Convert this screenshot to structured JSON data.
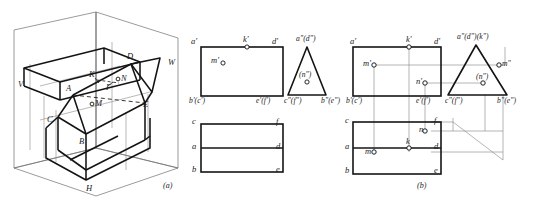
{
  "figure": {
    "captions": [
      {
        "id": "caption-a",
        "text": "(a)",
        "x": 163,
        "y": 186
      },
      {
        "id": "caption-b",
        "text": "(b)",
        "x": 417,
        "y": 186
      }
    ]
  },
  "pictorial": {
    "name": "isometric-projection-box",
    "plane_labels": [
      {
        "id": "plane-v",
        "text": "V",
        "x": 18,
        "y": 84
      },
      {
        "id": "plane-w",
        "text": "W",
        "x": 168,
        "y": 62
      },
      {
        "id": "plane-h",
        "text": "H",
        "x": 86,
        "y": 188
      }
    ],
    "vertex_labels": [
      {
        "id": "vertex-a",
        "text": "A",
        "x": 68,
        "y": 86
      },
      {
        "id": "vertex-b",
        "text": "B",
        "x": 79,
        "y": 141
      },
      {
        "id": "vertex-c",
        "text": "C",
        "x": 48,
        "y": 119
      },
      {
        "id": "vertex-d",
        "text": "D",
        "x": 127,
        "y": 56
      },
      {
        "id": "vertex-e",
        "text": "E",
        "x": 142,
        "y": 104
      },
      {
        "id": "vertex-f",
        "text": "F",
        "x": 109,
        "y": 88
      },
      {
        "id": "vertex-k",
        "text": "K",
        "x": 91,
        "y": 75
      },
      {
        "id": "point-m",
        "text": "M",
        "x": 96,
        "y": 104
      },
      {
        "id": "point-n",
        "text": "N",
        "x": 122,
        "y": 80
      }
    ]
  },
  "views_a": {
    "name": "three-view-set-unsolved",
    "front_view": {
      "name": "front-view-rectangle",
      "labels": [
        {
          "id": "fv-a-prime",
          "text": "a'",
          "x": 192,
          "y": 40
        },
        {
          "id": "fv-k-prime",
          "text": "k'",
          "x": 244,
          "y": 38
        },
        {
          "id": "fv-d-prime",
          "text": "d'",
          "x": 271,
          "y": 40
        },
        {
          "id": "fv-m-prime",
          "text": "m'",
          "x": 210,
          "y": 58
        },
        {
          "id": "fv-bc-prime",
          "text": "b'(c')",
          "x": 190,
          "y": 98
        },
        {
          "id": "fv-ef-prime",
          "text": "e'(f')",
          "x": 253,
          "y": 98
        }
      ]
    },
    "side_view": {
      "name": "side-view-triangle",
      "labels": [
        {
          "id": "sv-ad-dprime",
          "text": "a\"(d\")",
          "x": 304,
          "y": 38
        },
        {
          "id": "sv-n-dprime",
          "text": "(n\")",
          "x": 309,
          "y": 74
        },
        {
          "id": "sv-cf-dprime",
          "text": "c\"(f\")",
          "x": 287,
          "y": 98
        },
        {
          "id": "sv-be-dprime",
          "text": "b\"(e\")",
          "x": 324,
          "y": 98
        }
      ]
    },
    "top_view": {
      "name": "top-view-rectangle",
      "labels": [
        {
          "id": "tv-c",
          "text": "c",
          "x": 192,
          "y": 118
        },
        {
          "id": "tv-f",
          "text": "f",
          "x": 274,
          "y": 118
        },
        {
          "id": "tv-a",
          "text": "a",
          "x": 192,
          "y": 142
        },
        {
          "id": "tv-d",
          "text": "d",
          "x": 274,
          "y": 142
        },
        {
          "id": "tv-b",
          "text": "b",
          "x": 192,
          "y": 165
        },
        {
          "id": "tv-e",
          "text": "e",
          "x": 274,
          "y": 165
        }
      ]
    }
  },
  "views_b": {
    "name": "three-view-set-solved",
    "front_view": {
      "name": "front-view-rectangle-b",
      "labels": [
        {
          "id": "fvb-a-prime",
          "text": "a'",
          "x": 350,
          "y": 40
        },
        {
          "id": "fvb-k-prime",
          "text": "k'",
          "x": 406,
          "y": 38
        },
        {
          "id": "fvb-d-prime",
          "text": "d'",
          "x": 433,
          "y": 40
        },
        {
          "id": "fvb-m-prime",
          "text": "m'",
          "x": 372,
          "y": 66
        },
        {
          "id": "fvb-n-prime",
          "text": "n'",
          "x": 423,
          "y": 84
        },
        {
          "id": "fvb-bc-prime",
          "text": "b'(c')",
          "x": 348,
          "y": 101
        },
        {
          "id": "fvb-ef-prime",
          "text": "e'(f')",
          "x": 417,
          "y": 101
        }
      ]
    },
    "side_view": {
      "name": "side-view-triangle-b",
      "labels": [
        {
          "id": "svb-adk",
          "text": "a\"(d\")(k\")",
          "x": 468,
          "y": 36
        },
        {
          "id": "svb-m-dprime",
          "text": "m\"",
          "x": 507,
          "y": 67
        },
        {
          "id": "svb-n-dprime",
          "text": "(n\")",
          "x": 483,
          "y": 78
        },
        {
          "id": "svb-cf-dprime",
          "text": "c\"(f\")",
          "x": 450,
          "y": 101
        },
        {
          "id": "svb-be-dprime",
          "text": "b\"(e\")",
          "x": 500,
          "y": 101
        }
      ]
    },
    "top_view": {
      "name": "top-view-rectangle-b",
      "labels": [
        {
          "id": "tvb-c",
          "text": "c",
          "x": 348,
          "y": 120
        },
        {
          "id": "tvb-f",
          "text": "f",
          "x": 431,
          "y": 120
        },
        {
          "id": "tvb-a",
          "text": "a",
          "x": 348,
          "y": 143
        },
        {
          "id": "tvb-d",
          "text": "d",
          "x": 431,
          "y": 143
        },
        {
          "id": "tvb-b",
          "text": "b",
          "x": 348,
          "y": 166
        },
        {
          "id": "tvb-e",
          "text": "e",
          "x": 431,
          "y": 166
        },
        {
          "id": "tvb-k",
          "text": "k",
          "x": 409,
          "y": 138
        },
        {
          "id": "tvb-n",
          "text": "n",
          "x": 424,
          "y": 131
        },
        {
          "id": "tvb-m",
          "text": "m",
          "x": 372,
          "y": 152
        }
      ]
    }
  },
  "colors": {
    "ink": "#1a1a1a",
    "thin": "#6d6d6d",
    "paper": "#ffffff"
  }
}
